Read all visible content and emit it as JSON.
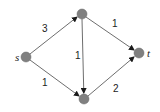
{
  "graph": {
    "nodes": [
      {
        "id": "s",
        "label": "s",
        "x": 26,
        "y": 57
      },
      {
        "id": "a",
        "label": "",
        "x": 82,
        "y": 14
      },
      {
        "id": "b",
        "label": "",
        "x": 84,
        "y": 99
      },
      {
        "id": "t",
        "label": "t",
        "x": 139,
        "y": 53
      }
    ],
    "edges": [
      {
        "from": "s",
        "to": "a",
        "weight": "3"
      },
      {
        "from": "s",
        "to": "b",
        "weight": "1"
      },
      {
        "from": "a",
        "to": "b",
        "weight": "1"
      },
      {
        "from": "a",
        "to": "t",
        "weight": "1"
      },
      {
        "from": "b",
        "to": "t",
        "weight": "2"
      }
    ],
    "colors": {
      "node": "#808080",
      "edge": "#6e6e6e",
      "arrow": "#1a1a1a"
    }
  }
}
